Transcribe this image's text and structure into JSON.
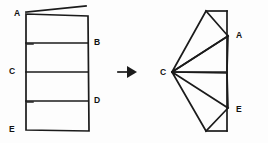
{
  "figure": {
    "background_color": "#fdfdfd",
    "line_color": "#1b1b1b",
    "label_color": "#111111",
    "transition_symbol": "arrow-right"
  },
  "left_figure": {
    "name": "unfolded-strip",
    "description": "Flat rectangular strip divided into four bands by three horizontal crease lines",
    "labels": [
      {
        "id": "A",
        "text": "A",
        "x": 14,
        "y": 13,
        "side": "left"
      },
      {
        "id": "B",
        "text": "B",
        "x": 94,
        "y": 42,
        "side": "right"
      },
      {
        "id": "C",
        "text": "C",
        "x": 9,
        "y": 71,
        "side": "left"
      },
      {
        "id": "D",
        "text": "D",
        "x": 94,
        "y": 100,
        "side": "right"
      },
      {
        "id": "E",
        "text": "E",
        "x": 9,
        "y": 129,
        "side": "left"
      }
    ],
    "outline": [
      {
        "x": 26,
        "y": 14
      },
      {
        "x": 88,
        "y": 16
      },
      {
        "x": 89,
        "y": 131
      },
      {
        "x": 26,
        "y": 130
      }
    ],
    "top_flap": [
      {
        "x": 26,
        "y": 12
      },
      {
        "x": 86,
        "y": 6
      }
    ],
    "creases": [
      {
        "id": "crease-B",
        "x1": 26,
        "y1": 43,
        "x2": 88,
        "y2": 43
      },
      {
        "id": "crease-C",
        "x1": 26,
        "y1": 72,
        "x2": 88,
        "y2": 72
      },
      {
        "id": "crease-D",
        "x1": 26,
        "y1": 101,
        "x2": 88,
        "y2": 101
      }
    ]
  },
  "arrow": {
    "name": "transition-arrow",
    "direction": "right",
    "x": 118,
    "y": 72,
    "length": 17
  },
  "right_figure": {
    "name": "folded-fan",
    "description": "Same strip folded into a fan radiating from vertex C, with A and E meeting the vertical edge",
    "apex": {
      "id": "C",
      "x": 172,
      "y": 72
    },
    "labels": [
      {
        "id": "A",
        "text": "A",
        "x": 236,
        "y": 35,
        "side": "right"
      },
      {
        "id": "C",
        "text": "C",
        "x": 162,
        "y": 72,
        "side": "left"
      },
      {
        "id": "E",
        "text": "E",
        "x": 236,
        "y": 109,
        "side": "right"
      }
    ],
    "vertical_edge": {
      "x": 227,
      "y1": 11,
      "y2": 131
    },
    "panels": [
      {
        "id": "panel-upper-outer",
        "points": [
          {
            "x": 172,
            "y": 72
          },
          {
            "x": 206,
            "y": 11
          },
          {
            "x": 228,
            "y": 36
          }
        ]
      },
      {
        "id": "panel-upper-tab",
        "points": [
          {
            "x": 206,
            "y": 11
          },
          {
            "x": 227,
            "y": 11
          },
          {
            "x": 228,
            "y": 36
          }
        ]
      },
      {
        "id": "panel-upper-inner",
        "points": [
          {
            "x": 172,
            "y": 72
          },
          {
            "x": 228,
            "y": 36
          },
          {
            "x": 227,
            "y": 71
          }
        ]
      },
      {
        "id": "panel-lower-inner",
        "points": [
          {
            "x": 172,
            "y": 72
          },
          {
            "x": 227,
            "y": 73
          },
          {
            "x": 228,
            "y": 108
          }
        ]
      },
      {
        "id": "panel-lower-outer",
        "points": [
          {
            "x": 172,
            "y": 72
          },
          {
            "x": 228,
            "y": 108
          },
          {
            "x": 206,
            "y": 131
          }
        ]
      },
      {
        "id": "panel-lower-tab",
        "points": [
          {
            "x": 206,
            "y": 131
          },
          {
            "x": 227,
            "y": 131
          },
          {
            "x": 228,
            "y": 108
          }
        ]
      }
    ]
  }
}
